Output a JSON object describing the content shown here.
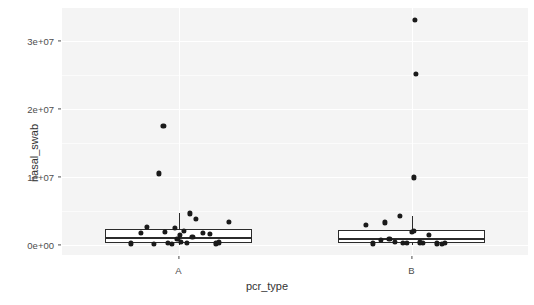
{
  "chart_data": {
    "type": "boxplot",
    "title": "",
    "xlabel": "pcr_type",
    "ylabel": "nasal_swab",
    "categories": [
      "A",
      "B"
    ],
    "ylim": [
      -1500000,
      34800000
    ],
    "grid": true,
    "legend": "none",
    "ytick_labels": [
      "0e+00",
      "1e+07",
      "2e+07",
      "3e+07"
    ],
    "ytick_values": [
      0,
      10000000,
      20000000,
      30000000
    ],
    "point_color": "#1a1a1a",
    "box_line_color": "#2b2b2b",
    "panel_background": "#f4f4f4",
    "grid_color": "#ffffff",
    "boxes": [
      {
        "category": "A",
        "lower_whisker": 0,
        "q1": 300000,
        "median": 1100000,
        "q3": 2300000,
        "upper_whisker": 4600000,
        "outliers": [
          10500000,
          17500000
        ]
      },
      {
        "category": "B",
        "lower_whisker": 0,
        "q1": 200000,
        "median": 1000000,
        "q3": 2200000,
        "upper_whisker": 4200000,
        "outliers": [
          9900000,
          25100000,
          33000000
        ]
      }
    ],
    "series": [
      {
        "name": "A",
        "points": [
          {
            "x_offset": -0.205,
            "y": 200000
          },
          {
            "x_offset": -0.16,
            "y": 1700000
          },
          {
            "x_offset": -0.135,
            "y": 2600000
          },
          {
            "x_offset": -0.105,
            "y": 150000
          },
          {
            "x_offset": -0.06,
            "y": 1900000
          },
          {
            "x_offset": -0.045,
            "y": 300000
          },
          {
            "x_offset": -0.03,
            "y": 100000
          },
          {
            "x_offset": -0.015,
            "y": 2500000
          },
          {
            "x_offset": -0.005,
            "y": 900000
          },
          {
            "x_offset": 0.005,
            "y": 1500000
          },
          {
            "x_offset": 0.01,
            "y": 400000
          },
          {
            "x_offset": 0.022,
            "y": 2000000
          },
          {
            "x_offset": 0.035,
            "y": 250000
          },
          {
            "x_offset": 0.05,
            "y": 4600000
          },
          {
            "x_offset": 0.06,
            "y": 1200000
          },
          {
            "x_offset": 0.075,
            "y": 3800000
          },
          {
            "x_offset": 0.105,
            "y": 1800000
          },
          {
            "x_offset": 0.135,
            "y": 1600000
          },
          {
            "x_offset": 0.16,
            "y": 200000
          },
          {
            "x_offset": 0.175,
            "y": 350000
          },
          {
            "x_offset": 0.215,
            "y": 3400000
          },
          {
            "x_offset": -0.085,
            "y": 10500000
          },
          {
            "x_offset": -0.065,
            "y": 17500000
          }
        ]
      },
      {
        "name": "B",
        "points": [
          {
            "x_offset": -0.195,
            "y": 2900000
          },
          {
            "x_offset": -0.165,
            "y": 200000
          },
          {
            "x_offset": -0.13,
            "y": 700000
          },
          {
            "x_offset": -0.115,
            "y": 3300000
          },
          {
            "x_offset": -0.095,
            "y": 900000
          },
          {
            "x_offset": -0.07,
            "y": 400000
          },
          {
            "x_offset": -0.05,
            "y": 4200000
          },
          {
            "x_offset": -0.038,
            "y": 250000
          },
          {
            "x_offset": -0.02,
            "y": 300000
          },
          {
            "x_offset": 0.0,
            "y": 1900000
          },
          {
            "x_offset": 0.01,
            "y": 2000000
          },
          {
            "x_offset": 0.035,
            "y": 350000
          },
          {
            "x_offset": 0.048,
            "y": 250000
          },
          {
            "x_offset": 0.075,
            "y": 1500000
          },
          {
            "x_offset": 0.11,
            "y": 200000
          },
          {
            "x_offset": 0.13,
            "y": 180000
          },
          {
            "x_offset": 0.145,
            "y": 250000
          },
          {
            "x_offset": 0.01,
            "y": 9900000
          },
          {
            "x_offset": 0.02,
            "y": 25100000
          },
          {
            "x_offset": 0.014,
            "y": 33000000
          }
        ]
      }
    ]
  }
}
